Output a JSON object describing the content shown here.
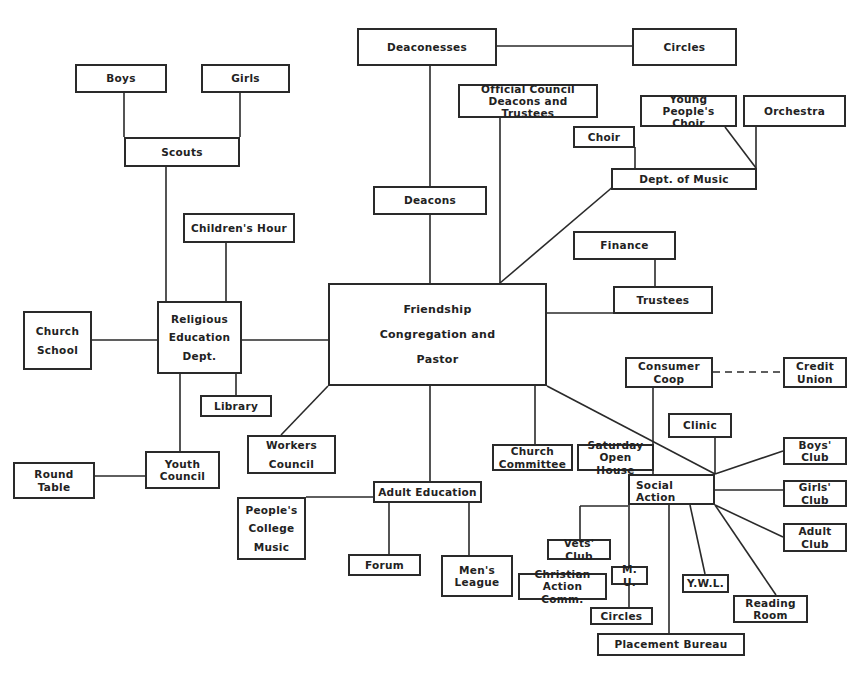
{
  "diagram": {
    "nodes": {
      "deaconesses": "Deaconesses",
      "circles_top": "Circles",
      "boys": "Boys",
      "girls": "Girls",
      "scouts": "Scouts",
      "official_council": "Official Council\nDeacons and Trustees",
      "young_peoples_choir": "Young People's\nChoir",
      "orchestra": "Orchestra",
      "choir": "Choir",
      "dept_of_music": "Dept. of Music",
      "deacons": "Deacons",
      "childrens_hour": "Children's Hour",
      "finance": "Finance",
      "trustees": "Trustees",
      "friendship": "Friendship\nCongregation and\nPastor",
      "church_school": "Church\nSchool",
      "religious_education": "Religious\nEducation\nDept.",
      "library": "Library",
      "consumer_coop": "Consumer\nCoop",
      "credit_union": "Credit\nUnion",
      "clinic": "Clinic",
      "workers_council": "Workers\nCouncil",
      "church_committee": "Church\nCommittee",
      "saturday_open_house": "Saturday\nOpen House",
      "boys_club": "Boys'\nClub",
      "social_action": "Social\n      Action",
      "girls_club": "Girls'\nClub",
      "youth_council": "Youth\nCouncil",
      "round_table": "Round\nTable",
      "adult_education": "Adult  Education",
      "peoples_college_music": "People's\nCollege\nMusic",
      "adult_club": "Adult\nClub",
      "vets_club": "Vets' Club",
      "forum": "Forum",
      "mens_league": "Men's\nLeague",
      "mu": "M. U.",
      "christian_action_comm": "Christian\nAction Comm.",
      "ywl": "Y.W.L.",
      "reading_room": "Reading\nRoom",
      "circles_bottom": "Circles",
      "placement_bureau": "Placement Bureau"
    },
    "edges": [
      [
        "friendship",
        "deacons"
      ],
      [
        "deacons",
        "deaconesses"
      ],
      [
        "deaconesses",
        "circles_top"
      ],
      [
        "friendship",
        "official_council"
      ],
      [
        "friendship",
        "dept_of_music"
      ],
      [
        "dept_of_music",
        "choir"
      ],
      [
        "dept_of_music",
        "young_peoples_choir"
      ],
      [
        "dept_of_music",
        "orchestra"
      ],
      [
        "friendship",
        "trustees"
      ],
      [
        "trustees",
        "finance"
      ],
      [
        "friendship",
        "religious_education"
      ],
      [
        "religious_education",
        "scouts"
      ],
      [
        "scouts",
        "boys"
      ],
      [
        "scouts",
        "girls"
      ],
      [
        "religious_education",
        "childrens_hour"
      ],
      [
        "religious_education",
        "church_school"
      ],
      [
        "religious_education",
        "library"
      ],
      [
        "religious_education",
        "youth_council"
      ],
      [
        "youth_council",
        "round_table"
      ],
      [
        "friendship",
        "workers_council"
      ],
      [
        "friendship",
        "adult_education"
      ],
      [
        "adult_education",
        "peoples_college_music"
      ],
      [
        "adult_education",
        "forum"
      ],
      [
        "adult_education",
        "mens_league"
      ],
      [
        "friendship",
        "church_committee"
      ],
      [
        "friendship",
        "social_action"
      ],
      [
        "social_action",
        "consumer_coop"
      ],
      [
        "consumer_coop",
        "credit_union",
        "dashed"
      ],
      [
        "social_action",
        "clinic"
      ],
      [
        "social_action",
        "boys_club"
      ],
      [
        "social_action",
        "girls_club"
      ],
      [
        "social_action",
        "adult_club"
      ],
      [
        "social_action",
        "reading_room"
      ],
      [
        "social_action",
        "ywl"
      ],
      [
        "social_action",
        "placement_bureau"
      ],
      [
        "social_action",
        "mu"
      ],
      [
        "mu",
        "circles_bottom"
      ],
      [
        "social_action",
        "vets_club"
      ],
      [
        "social_action",
        "saturday_open_house"
      ]
    ]
  }
}
